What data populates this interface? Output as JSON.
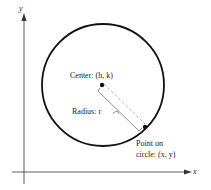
{
  "diagram": {
    "axes": {
      "x_label": "x",
      "y_label": "y"
    },
    "center_label": "Center: (h, k)",
    "radius_label": "Radius: r",
    "point_label_line1": "Point on",
    "point_label_line2": "circle: (x, y)"
  }
}
